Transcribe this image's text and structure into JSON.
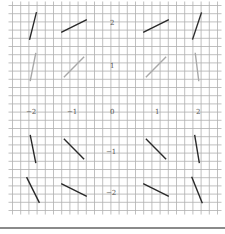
{
  "figure": {
    "title": "",
    "x_tick_labels": [
      "−2",
      "−1",
      "0",
      "1",
      "2"
    ],
    "y_tick_labels": [
      "2",
      "1",
      "−1",
      "−2"
    ],
    "origin_label": "0",
    "colors": {
      "minor_grid": "#b0b0b0",
      "major_grid": "#3a3a3a",
      "dark_segment": "#2a2a2a",
      "faint_segment": "#a8a8a8",
      "label": "#555555",
      "bottom_rule": "#8a8a8a"
    }
  },
  "grid": {
    "x_range": [
      -2.5,
      2.5
    ],
    "y_range": [
      -2.5,
      2.5
    ],
    "major_step": 1,
    "minor_divisions": 5,
    "pixel_origin": [
      115,
      108
    ],
    "pixel_per_unit": 41
  },
  "slope_segments": [
    {
      "x": -2,
      "y": 2,
      "slope": 4,
      "style": "dark"
    },
    {
      "x": -1,
      "y": 2,
      "slope": 0.5,
      "style": "dark"
    },
    {
      "x": 1,
      "y": 2,
      "slope": 0.5,
      "style": "dark"
    },
    {
      "x": 2,
      "y": 2,
      "slope": 3,
      "style": "dark"
    },
    {
      "x": -2,
      "y": 1,
      "slope": 5,
      "style": "faint"
    },
    {
      "x": -1,
      "y": 1,
      "slope": 1,
      "style": "faint"
    },
    {
      "x": 1,
      "y": 1,
      "slope": 1,
      "style": "faint"
    },
    {
      "x": 2,
      "y": 1,
      "slope": -8,
      "style": "faint"
    },
    {
      "x": -2,
      "y": -1,
      "slope": -5,
      "style": "dark"
    },
    {
      "x": -1,
      "y": -1,
      "slope": -1,
      "style": "dark"
    },
    {
      "x": 1,
      "y": -1,
      "slope": -1,
      "style": "dark"
    },
    {
      "x": 2,
      "y": -1,
      "slope": -6,
      "style": "dark"
    },
    {
      "x": -2,
      "y": -2,
      "slope": -2,
      "style": "dark"
    },
    {
      "x": -1,
      "y": -2,
      "slope": -0.5,
      "style": "dark"
    },
    {
      "x": 1,
      "y": -2,
      "slope": -0.5,
      "style": "dark"
    },
    {
      "x": 2,
      "y": -2,
      "slope": -2.5,
      "style": "dark"
    }
  ]
}
